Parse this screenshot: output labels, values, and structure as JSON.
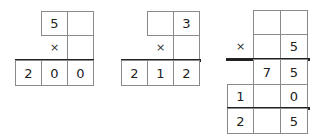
{
  "puzzles": [
    {
      "id": 1,
      "operator": "×",
      "multiplicand": [
        "5",
        ""
      ],
      "multiplier": [
        ""
      ],
      "product": [
        "2",
        "0",
        "0"
      ]
    },
    {
      "id": 2,
      "operator": "×",
      "multiplicand": [
        "",
        "3"
      ],
      "multiplier": [
        ""
      ],
      "product": [
        "2",
        "1",
        "2"
      ]
    },
    {
      "id": 3,
      "operator": "×",
      "multiplicand": [
        "",
        ""
      ],
      "multiplier": [
        "",
        "5"
      ],
      "partial_product_1": [
        "7",
        "5"
      ],
      "partial_product_2": [
        "1",
        "",
        "0"
      ],
      "total": [
        "2",
        "",
        "5"
      ]
    }
  ]
}
